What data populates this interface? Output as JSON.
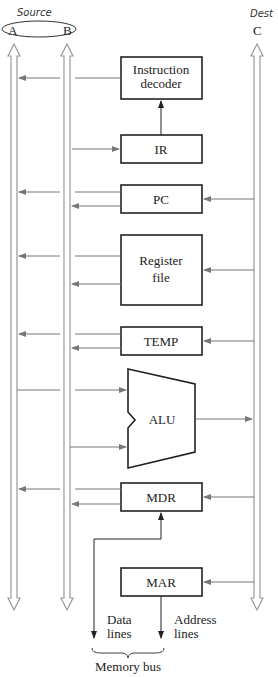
{
  "diagram": {
    "handwritten": {
      "source": "Source",
      "dest": "Dest"
    },
    "buses": [
      {
        "id": "A",
        "label": "A"
      },
      {
        "id": "B",
        "label": "B"
      },
      {
        "id": "C",
        "label": "C"
      }
    ],
    "blocks": {
      "instruction_decoder": {
        "line1": "Instruction",
        "line2": "decoder"
      },
      "ir": "IR",
      "pc": "PC",
      "register_file": {
        "line1": "Register",
        "line2": "file"
      },
      "temp": "TEMP",
      "alu": "ALU",
      "mdr": "MDR",
      "mar": "MAR"
    },
    "memory": {
      "data_lines": {
        "line1": "Data",
        "line2": "lines"
      },
      "address_lines": {
        "line1": "Address",
        "line2": "lines"
      },
      "bus_label": "Memory bus"
    }
  }
}
